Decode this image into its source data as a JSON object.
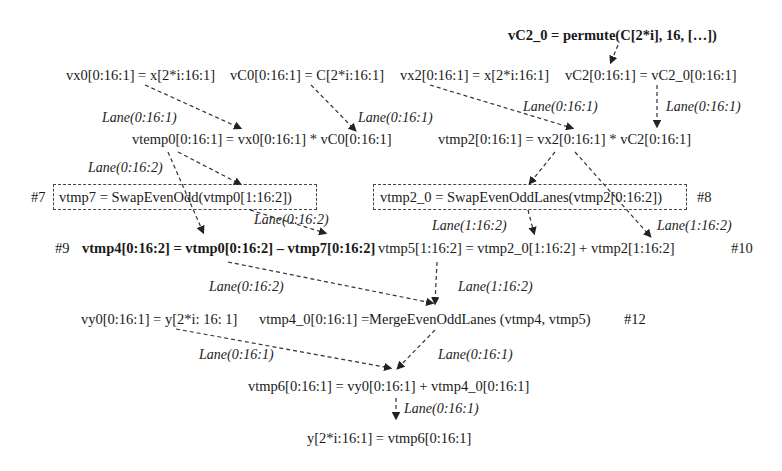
{
  "nodes": {
    "permute": "vC2_0 = permute(C[2*i], 16, […])",
    "vx0": "vx0[0:16:1] = x[2*i:16:1]",
    "vC0": "vC0[0:16:1] = C[2*i:16:1]",
    "vx2": "vx2[0:16:1] = x[2*i:16:1]",
    "vC2": "vC2[0:16:1] = vC2_0[0:16:1]",
    "vtemp0": "vtemp0[0:16:1] = vx0[0:16:1] * vC0[0:16:1]",
    "vtmp2": "vtmp2[0:16:1] = vx2[0:16:1] * vC2[0:16:1]",
    "vtmp7": "vtmp7 = SwapEvenOdd(vtmp0[1:16:2])",
    "vtmp7_tag": "#7",
    "vtmp2_0": "vtmp2_0 = SwapEvenOddLanes(vtmp2[0:16:2])",
    "vtmp2_0_tag": "#8",
    "vtmp4_tag": "#9",
    "vtmp4": "vtmp4[0:16:2] = vtmp0[0:16:2] – vtmp7[0:16:2]",
    "vtmp5": "vtmp5[1:16:2] = vtmp2_0[1:16:2] + vtmp2[1:16:2]",
    "vtmp5_tag": "#10",
    "vy0": "vy0[0:16:1] = y[2*i: 16: 1]",
    "vtmp4_0": "vtmp4_0[0:16:1] =MergeEvenOddLanes (vtmp4, vtmp5)",
    "vtmp4_0_tag": "#12",
    "vtmp6": "vtmp6[0:16:1] = vy0[0:16:1] + vtmp4_0[0:16:1]",
    "y_out": "y[2*i:16:1] = vtmp6[0:16:1]"
  },
  "edge_labels": {
    "vx0_to_vtemp0": "Lane(0:16:1)",
    "vC0_to_vtemp0": "Lane(0:16:1)",
    "vx2_to_vtmp2": "Lane(0:16:1)",
    "vC2_to_vtmp2": "Lane(0:16:1)",
    "vtemp0_to_vtmp4": "Lane(0:16:2)",
    "vtmp7_to_vtmp4": "Lane(0:16:2)",
    "vtmp2_0_to_vtmp5": "Lane(1:16:2)",
    "vtmp2_to_vtmp5": "Lane(1:16:2)",
    "vtmp4_to_merge": "Lane(0:16:2)",
    "vtmp5_to_merge": "Lane(1:16:2)",
    "vy0_to_vtmp6": "Lane(0:16:1)",
    "merge_to_vtmp6": "Lane(0:16:1)",
    "vtmp6_to_y": "Lane(0:16:1)"
  }
}
